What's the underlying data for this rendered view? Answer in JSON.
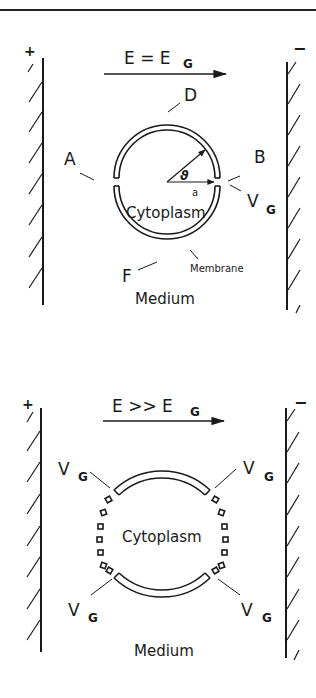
{
  "figure": {
    "panels": [
      {
        "id": "top",
        "field_label": "E = E",
        "field_subscript": "G",
        "electrode_left_sign": "+",
        "electrode_right_sign": "−",
        "labels": {
          "D": "D",
          "A": "A",
          "B": "B",
          "F": "F",
          "angle": "ϑ",
          "radius": "a",
          "voltage": "V",
          "voltage_subscript": "G",
          "cytoplasm": "Cytoplasm",
          "membrane": "Membrane",
          "medium": "Medium"
        }
      },
      {
        "id": "bottom",
        "field_label": "E >> E",
        "field_subscript": "G",
        "electrode_left_sign": "+",
        "electrode_right_sign": "−",
        "labels": {
          "voltage": "V",
          "voltage_subscript": "G",
          "cytoplasm": "Cytoplasm",
          "medium": "Medium"
        }
      }
    ],
    "colors": {
      "ink": "#1a1a1a",
      "background": "#ffffff"
    }
  }
}
